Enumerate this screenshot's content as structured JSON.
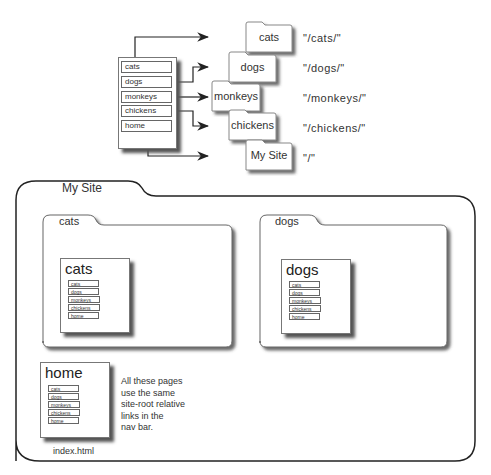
{
  "top_diagram": {
    "nav_items": [
      "cats",
      "dogs",
      "monkeys",
      "chickens",
      "home"
    ],
    "folders": [
      {
        "label": "cats",
        "path": "\"/cats/\""
      },
      {
        "label": "dogs",
        "path": "\"/dogs/\""
      },
      {
        "label": "monkeys",
        "path": "\"/monkeys/\""
      },
      {
        "label": "chickens",
        "path": "\"/chickens/\""
      },
      {
        "label": "My Site",
        "path": "\"/\""
      }
    ]
  },
  "site_folder": {
    "label": "My Site",
    "subfolders": [
      {
        "label": "cats",
        "page_title": "cats"
      },
      {
        "label": "dogs",
        "page_title": "dogs"
      }
    ],
    "home_page": {
      "title": "home",
      "filename": "index.html"
    },
    "nav_items": [
      "cats",
      "dogs",
      "monkeys",
      "chickens",
      "home"
    ],
    "note_lines": [
      "All these pages",
      "use the same",
      "site-root relative",
      "links in the",
      "nav bar."
    ]
  }
}
